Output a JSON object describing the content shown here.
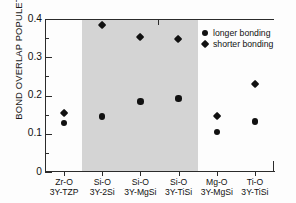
{
  "chart_data": {
    "type": "scatter",
    "title": "",
    "xlabel": "",
    "ylabel": "BOND OVERLAP POPULETION",
    "ylim": [
      0,
      0.4
    ],
    "ytick_labels": [
      "0",
      "0.1",
      "0.2",
      "0.3",
      "0.4"
    ],
    "ytick_values": [
      0,
      0.1,
      0.2,
      0.3,
      0.4
    ],
    "yminor_step": 0.05,
    "grid": false,
    "legend_position": "top-right",
    "categories": [
      {
        "bond": "Zr-O",
        "material": "3Y-TZP"
      },
      {
        "bond": "Si-O",
        "material": "3Y-2Si"
      },
      {
        "bond": "Si-O",
        "material": "3Y-MgSi"
      },
      {
        "bond": "Si-O",
        "material": "3Y-TiSi"
      },
      {
        "bond": "Mg-O",
        "material": "3Y-MgSi"
      },
      {
        "bond": "Ti-O",
        "material": "3Y-TiSi"
      }
    ],
    "series": [
      {
        "name": "longer bonding",
        "marker": "circle",
        "color": "#111111",
        "values": [
          0.128,
          0.145,
          0.184,
          0.192,
          0.104,
          0.132
        ]
      },
      {
        "name": "shorter bonding",
        "marker": "diamond",
        "color": "#111111",
        "values": [
          0.153,
          0.385,
          0.352,
          0.348,
          0.147,
          0.231
        ]
      }
    ],
    "shaded_region": {
      "label": "",
      "from_category_index": 1,
      "to_category_index": 3,
      "color": "#d4d4d4"
    }
  },
  "legend": {
    "items": [
      {
        "label": "longer bonding",
        "marker": "circle-marker-icon"
      },
      {
        "label": "shorter bonding",
        "marker": "diamond-marker-icon"
      }
    ]
  }
}
